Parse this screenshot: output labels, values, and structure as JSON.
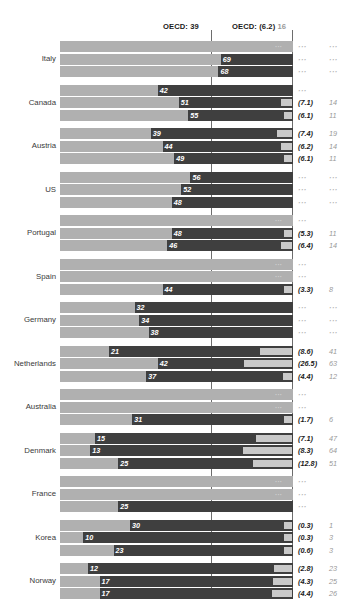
{
  "header": {
    "left_ref_label": "OECD: 39",
    "right_ref_label": "OECD: (6.2)",
    "right_ref_sub": "16"
  },
  "chart_data": {
    "type": "bar",
    "title": "",
    "xlabel": "",
    "ylabel": "",
    "grid": false,
    "legend": "none",
    "axis_reference_lines": [
      {
        "label": "OECD: 39",
        "value": 39
      },
      {
        "label": "OECD: (6.2) 16",
        "value": 62
      }
    ],
    "xlim": [
      0,
      100
    ],
    "categories": [
      "Italy",
      "Canada",
      "Austria",
      "US",
      "Portugal",
      "Spain",
      "Germany",
      "Netherlands",
      "Australia",
      "Denmark",
      "France",
      "Korea",
      "Norway"
    ],
    "note": "Each country has 3 stacked rows (one per period). Bar value = dark share; right columns = paired rate and index.",
    "groups": [
      {
        "country": "Italy",
        "rows": [
          {
            "value": null,
            "label": "",
            "right1": "...",
            "right2": "...",
            "seg": 0
          },
          {
            "value": 69,
            "label": "69",
            "right1": "...",
            "right2": "...",
            "seg": 0
          },
          {
            "value": 68,
            "label": "68",
            "right1": "...",
            "right2": "...",
            "seg": 0
          }
        ]
      },
      {
        "country": "Canada",
        "rows": [
          {
            "value": 42,
            "label": "42",
            "right1": "...",
            "right2": "",
            "seg": 0
          },
          {
            "value": 51,
            "label": "51",
            "right1": "(7.1)",
            "right2": "14",
            "seg": 14
          },
          {
            "value": 55,
            "label": "55",
            "right1": "(6.1)",
            "right2": "11",
            "seg": 11
          }
        ]
      },
      {
        "country": "Austria",
        "rows": [
          {
            "value": 39,
            "label": "39",
            "right1": "(7.4)",
            "right2": "19",
            "seg": 19
          },
          {
            "value": 44,
            "label": "44",
            "right1": "(6.2)",
            "right2": "14",
            "seg": 14
          },
          {
            "value": 49,
            "label": "49",
            "right1": "(6.1)",
            "right2": "11",
            "seg": 11
          }
        ]
      },
      {
        "country": "US",
        "rows": [
          {
            "value": 56,
            "label": "56",
            "right1": "...",
            "right2": "...",
            "seg": 0
          },
          {
            "value": 52,
            "label": "52",
            "right1": "...",
            "right2": "...",
            "seg": 0
          },
          {
            "value": 48,
            "label": "48",
            "right1": "...",
            "right2": "...",
            "seg": 0
          }
        ]
      },
      {
        "country": "Portugal",
        "rows": [
          {
            "value": null,
            "label": "",
            "right1": "...",
            "right2": "",
            "seg": 0
          },
          {
            "value": 48,
            "label": "48",
            "right1": "(5.3)",
            "right2": "11",
            "seg": 11
          },
          {
            "value": 46,
            "label": "46",
            "right1": "(6.4)",
            "right2": "14",
            "seg": 14
          }
        ]
      },
      {
        "country": "Spain",
        "rows": [
          {
            "value": null,
            "label": "",
            "right1": "...",
            "right2": "",
            "seg": 0
          },
          {
            "value": null,
            "label": "",
            "right1": "...",
            "right2": "",
            "seg": 0
          },
          {
            "value": 44,
            "label": "44",
            "right1": "(3.3)",
            "right2": "8",
            "seg": 8
          }
        ]
      },
      {
        "country": "Germany",
        "rows": [
          {
            "value": 32,
            "label": "32",
            "right1": "...",
            "right2": "...",
            "seg": 0
          },
          {
            "value": 34,
            "label": "34",
            "right1": "...",
            "right2": "...",
            "seg": 0
          },
          {
            "value": 38,
            "label": "38",
            "right1": "...",
            "right2": "...",
            "seg": 0
          }
        ]
      },
      {
        "country": "Netherlands",
        "rows": [
          {
            "value": 21,
            "label": "21",
            "right1": "(8.6)",
            "right2": "41",
            "seg": 41
          },
          {
            "value": 42,
            "label": "42",
            "right1": "(26.5)",
            "right2": "63",
            "seg": 63
          },
          {
            "value": 37,
            "label": "37",
            "right1": "(4.4)",
            "right2": "12",
            "seg": 12
          }
        ]
      },
      {
        "country": "Australia",
        "rows": [
          {
            "value": null,
            "label": "",
            "right1": "...",
            "right2": "",
            "seg": 0
          },
          {
            "value": null,
            "label": "",
            "right1": "...",
            "right2": "",
            "seg": 0
          },
          {
            "value": 31,
            "label": "31",
            "right1": "(1.7)",
            "right2": "6",
            "seg": 6
          }
        ]
      },
      {
        "country": "Denmark",
        "rows": [
          {
            "value": 15,
            "label": "15",
            "right1": "(7.1)",
            "right2": "47",
            "seg": 47
          },
          {
            "value": 13,
            "label": "13",
            "right1": "(8.3)",
            "right2": "64",
            "seg": 64
          },
          {
            "value": 25,
            "label": "25",
            "right1": "(12.8)",
            "right2": "51",
            "seg": 51
          }
        ]
      },
      {
        "country": "France",
        "rows": [
          {
            "value": null,
            "label": "",
            "right1": "...",
            "right2": "",
            "seg": 0
          },
          {
            "value": null,
            "label": "",
            "right1": "...",
            "right2": "",
            "seg": 0
          },
          {
            "value": 25,
            "label": "25",
            "right1": "...",
            "right2": "",
            "seg": 0
          }
        ]
      },
      {
        "country": "Korea",
        "rows": [
          {
            "value": 30,
            "label": "30",
            "right1": "(0.3)",
            "right2": "1",
            "seg": 1
          },
          {
            "value": 10,
            "label": "10",
            "right1": "(0.3)",
            "right2": "3",
            "seg": 3
          },
          {
            "value": 23,
            "label": "23",
            "right1": "(0.6)",
            "right2": "3",
            "seg": 3
          }
        ]
      },
      {
        "country": "Norway",
        "rows": [
          {
            "value": 12,
            "label": "12",
            "right1": "(2.8)",
            "right2": "23",
            "seg": 23
          },
          {
            "value": 17,
            "label": "17",
            "right1": "(4.3)",
            "right2": "25",
            "seg": 25
          },
          {
            "value": 17,
            "label": "17",
            "right1": "(4.4)",
            "right2": "26",
            "seg": 26
          }
        ]
      }
    ]
  },
  "colors": {
    "track_dark": "#3f3f3f",
    "fill_light": "#b0b0b0",
    "segment": "#c9c9c9",
    "rule": "#6d6d6d",
    "value_text": "#ffffff",
    "right_primary": "#1a1a1a",
    "right_secondary": "#9a9a9a",
    "country_label": "#3a3a3a",
    "background": "#ffffff"
  }
}
